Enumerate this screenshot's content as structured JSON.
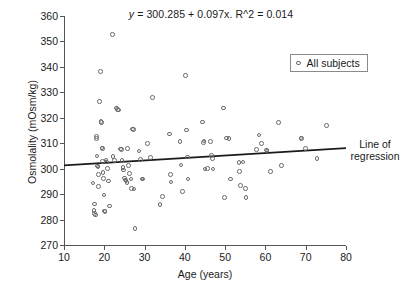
{
  "figure": {
    "equation_prefix": "y",
    "equation_rest": " = 300.285 + 0.097x. R^2 = 0.014",
    "regression_note_line1": "Line of",
    "regression_note_line2": "regression",
    "caption_fragment": ""
  },
  "legend": {
    "position": "top-right-inside",
    "entries": [
      {
        "label": "All subjects",
        "marker": "open-circle",
        "color": "#6b6b6b"
      }
    ]
  },
  "chart_data": {
    "type": "scatter",
    "title": "y = 300.285 + 0.097x. R^2 = 0.014",
    "xlabel": "Age (years)",
    "ylabel": "Osmolality (mOsm/kg)",
    "xlim": [
      10,
      80
    ],
    "ylim": [
      270,
      360
    ],
    "xticks": [
      10,
      20,
      30,
      40,
      50,
      60,
      70,
      80
    ],
    "yticks": [
      270,
      280,
      290,
      300,
      310,
      320,
      330,
      340,
      350,
      360
    ],
    "grid": false,
    "marker": "open-circle",
    "marker_color": "#6b6b6b",
    "series": [
      {
        "name": "All subjects",
        "points": [
          [
            17.2,
            294.3
          ],
          [
            17.4,
            283.6
          ],
          [
            17.5,
            282.4
          ],
          [
            17.6,
            286.1
          ],
          [
            17.8,
            281.8
          ],
          [
            18.0,
            312.6
          ],
          [
            18.1,
            311.9
          ],
          [
            18.2,
            305.0
          ],
          [
            18.3,
            301.1
          ],
          [
            18.4,
            300.6
          ],
          [
            18.5,
            297.6
          ],
          [
            18.6,
            293.0
          ],
          [
            18.8,
            326.4
          ],
          [
            19.0,
            338.1
          ],
          [
            19.2,
            318.5
          ],
          [
            19.3,
            318.2
          ],
          [
            19.4,
            308.2
          ],
          [
            19.5,
            307.9
          ],
          [
            19.6,
            302.8
          ],
          [
            19.7,
            298.4
          ],
          [
            19.8,
            296.2
          ],
          [
            19.9,
            289.6
          ],
          [
            20.0,
            283.4
          ],
          [
            20.2,
            283.2
          ],
          [
            20.4,
            303.4
          ],
          [
            20.6,
            302.6
          ],
          [
            20.8,
            300.0
          ],
          [
            21.0,
            295.1
          ],
          [
            21.3,
            285.4
          ],
          [
            22.0,
            352.7
          ],
          [
            22.2,
            304.7
          ],
          [
            22.5,
            303.2
          ],
          [
            23.0,
            323.9
          ],
          [
            23.3,
            323.3
          ],
          [
            23.6,
            323.0
          ],
          [
            24.0,
            307.8
          ],
          [
            24.2,
            307.6
          ],
          [
            24.4,
            303.1
          ],
          [
            24.6,
            300.4
          ],
          [
            24.8,
            299.4
          ],
          [
            25.0,
            296.4
          ],
          [
            25.2,
            295.6
          ],
          [
            25.4,
            295.1
          ],
          [
            25.6,
            294.6
          ],
          [
            25.8,
            307.9
          ],
          [
            26.0,
            301.2
          ],
          [
            26.3,
            298.0
          ],
          [
            26.6,
            296.0
          ],
          [
            26.8,
            292.2
          ],
          [
            27.0,
            315.6
          ],
          [
            27.2,
            315.3
          ],
          [
            27.4,
            292.0
          ],
          [
            27.6,
            276.4
          ],
          [
            28.6,
            306.9
          ],
          [
            29.0,
            303.5
          ],
          [
            29.4,
            296.0
          ],
          [
            29.6,
            295.9
          ],
          [
            30.8,
            310.0
          ],
          [
            31.4,
            304.4
          ],
          [
            32.0,
            328.0
          ],
          [
            33.8,
            286.0
          ],
          [
            34.4,
            289.0
          ],
          [
            36.2,
            313.7
          ],
          [
            36.4,
            297.8
          ],
          [
            36.6,
            294.7
          ],
          [
            38.8,
            310.6
          ],
          [
            39.0,
            301.4
          ],
          [
            39.4,
            291.0
          ],
          [
            40.2,
            336.7
          ],
          [
            40.4,
            315.2
          ],
          [
            40.6,
            304.6
          ],
          [
            40.8,
            295.9
          ],
          [
            44.4,
            318.4
          ],
          [
            44.6,
            310.4
          ],
          [
            44.8,
            310.8
          ],
          [
            45.0,
            299.8
          ],
          [
            45.6,
            300.0
          ],
          [
            46.4,
            310.6
          ],
          [
            46.6,
            305.2
          ],
          [
            46.8,
            303.9
          ],
          [
            47.0,
            299.8
          ],
          [
            49.6,
            323.9
          ],
          [
            49.8,
            288.6
          ],
          [
            50.4,
            312.0
          ],
          [
            51.0,
            311.8
          ],
          [
            51.4,
            295.9
          ],
          [
            53.4,
            302.4
          ],
          [
            53.6,
            298.9
          ],
          [
            53.8,
            293.4
          ],
          [
            54.4,
            302.6
          ],
          [
            55.0,
            292.2
          ],
          [
            55.2,
            288.6
          ],
          [
            57.8,
            307.6
          ],
          [
            58.4,
            313.2
          ],
          [
            59.0,
            309.9
          ],
          [
            60.2,
            307.3
          ],
          [
            60.4,
            306.9
          ],
          [
            61.2,
            298.8
          ],
          [
            63.2,
            318.2
          ],
          [
            64.0,
            301.2
          ],
          [
            68.8,
            312.1
          ],
          [
            69.0,
            311.9
          ],
          [
            70.0,
            307.9
          ],
          [
            72.8,
            303.9
          ],
          [
            75.2,
            316.9
          ]
        ]
      }
    ],
    "regression": {
      "intercept": 300.285,
      "slope": 0.097,
      "r_squared": 0.014,
      "x_start": 10,
      "x_end": 80,
      "label": "Line of regression",
      "color": "#1a1a1a"
    }
  }
}
